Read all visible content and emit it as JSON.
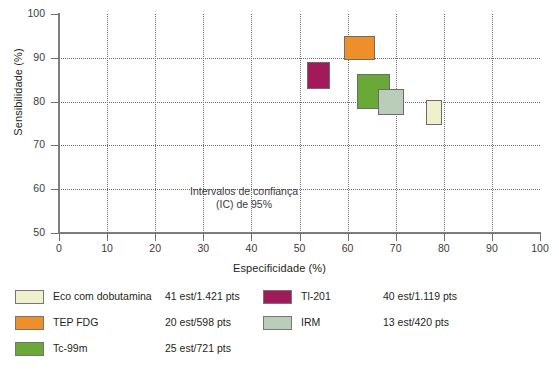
{
  "chart_data": {
    "type": "scatter",
    "title": "",
    "xlabel": "Especificidade (%)",
    "ylabel": "Sensibilidade (%)",
    "xlim": [
      0,
      100
    ],
    "ylim": [
      50,
      100
    ],
    "xticks": [
      "0",
      "10",
      "20",
      "30",
      "40",
      "50",
      "60",
      "70",
      "80",
      "90",
      "100"
    ],
    "yticks": [
      "50",
      "60",
      "70",
      "80",
      "90",
      "100"
    ],
    "grid": true,
    "annotation": {
      "line1": "Intervalos de confiança",
      "line2": "(IC) de 95%"
    },
    "series": [
      {
        "name": "Eco com dobutamina",
        "color": "#eef1cb",
        "stat": "41 est/1.421 pts",
        "x_range": [
          76.3,
          79.6
        ],
        "y_range": [
          74.6,
          80.4
        ]
      },
      {
        "name": "TEP FDG",
        "color": "#ef8f2a",
        "stat": "20 est/598 pts",
        "x_range": [
          59.2,
          65.7
        ],
        "y_range": [
          89.5,
          95.0
        ]
      },
      {
        "name": "Tc-99m",
        "color": "#6aa838",
        "stat": "25 est/721 pts",
        "x_range": [
          62.0,
          68.8
        ],
        "y_range": [
          78.3,
          86.2
        ]
      },
      {
        "name": "Tl-201",
        "color": "#a31a5b",
        "stat": "40 est/1.119 pts",
        "x_range": [
          51.6,
          56.3
        ],
        "y_range": [
          82.9,
          89.0
        ]
      },
      {
        "name": "IRM",
        "color": "#b9cdb9",
        "stat": "13 est/420 pts",
        "x_range": [
          66.3,
          71.7
        ],
        "y_range": [
          76.9,
          82.9
        ]
      }
    ]
  },
  "legend": {
    "column_left": [
      {
        "name": "Eco com dobutamina",
        "stat": "41 est/1.421 pts",
        "color": "#eef1cb"
      },
      {
        "name": "TEP FDG",
        "stat": "20 est/598 pts",
        "color": "#ef8f2a"
      },
      {
        "name": "Tc-99m",
        "stat": "25 est/721 pts",
        "color": "#6aa838"
      }
    ],
    "column_right": [
      {
        "name": "Tl-201",
        "stat": "40 est/1.119 pts",
        "color": "#a31a5b"
      },
      {
        "name": "IRM",
        "stat": "13 est/420 pts",
        "color": "#b9cdb9"
      }
    ]
  }
}
